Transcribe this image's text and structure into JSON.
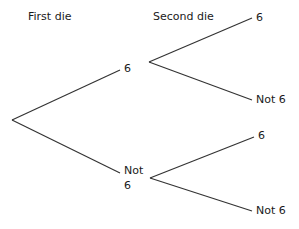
{
  "headers": {
    "first": "First die",
    "second": "Second die"
  },
  "tree": {
    "root": {
      "x": 12,
      "y": 120
    },
    "first_level": [
      {
        "label": "6",
        "end": {
          "x": 120,
          "y": 70
        },
        "node": {
          "x": 149,
          "y": 62
        },
        "children": [
          {
            "label": "6",
            "end": {
              "x": 252,
              "y": 18
            }
          },
          {
            "label": "Not 6",
            "end": {
              "x": 252,
              "y": 100
            }
          }
        ]
      },
      {
        "label_line1": "Not",
        "label_line2": "6",
        "end": {
          "x": 120,
          "y": 173
        },
        "node": {
          "x": 150,
          "y": 178
        },
        "children": [
          {
            "label": "6",
            "end": {
              "x": 254,
              "y": 137
            }
          },
          {
            "label": "Not 6",
            "end": {
              "x": 252,
              "y": 211
            }
          }
        ]
      }
    ]
  },
  "style": {
    "line_color": "#333333",
    "text_color": "#1a1a1a"
  }
}
